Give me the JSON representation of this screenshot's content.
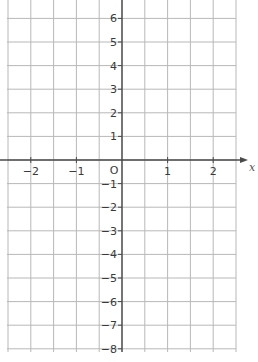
{
  "chart_data": {
    "type": "grid",
    "title": "",
    "xlabel": "x",
    "ylabel": "",
    "origin_label": "O",
    "xlim": [
      -2.5,
      2.5
    ],
    "ylim": [
      -8,
      6.75
    ],
    "x_ticks": [
      -2,
      -1,
      1,
      2
    ],
    "x_tick_labels": [
      "−2",
      "−1",
      "1",
      "2"
    ],
    "y_ticks": [
      6,
      5,
      4,
      3,
      2,
      1,
      -1,
      -2,
      -3,
      -4,
      -5,
      -6,
      -7,
      -8
    ],
    "y_tick_labels": [
      "6",
      "5",
      "4",
      "3",
      "2",
      "1",
      "−1",
      "−2",
      "−3",
      "−4",
      "−5",
      "−6",
      "−7",
      "−8"
    ],
    "grid": true,
    "x_grid_step": 0.5,
    "y_grid_step": 1,
    "series": []
  },
  "layout": {
    "origin_px": [
      122,
      160
    ],
    "x_unit_px": 45.6,
    "y_unit_px": 23.6,
    "grid_left_px": 7,
    "grid_right_px": 236,
    "grid_top_px": 0,
    "grid_bottom_px": 352,
    "axis_arrow_end_px": 248
  },
  "colors": {
    "grid": "#b8b8b8",
    "axis": "#4a4a4a",
    "text": "#3a3a3a"
  }
}
